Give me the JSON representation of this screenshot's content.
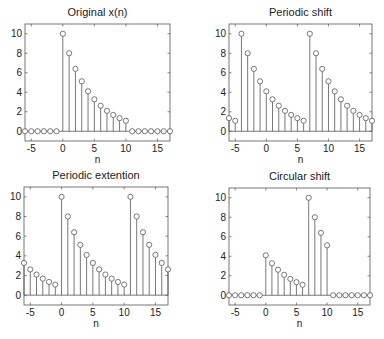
{
  "figure": {
    "width": 384,
    "height": 339,
    "background": "#ffffff",
    "stem_color": "#555555",
    "marker_color": "#444444"
  },
  "chart_data": [
    {
      "type": "stem",
      "title": "Original x(n)",
      "xlabel": "n",
      "ylabel": "",
      "xlim": [
        -6,
        17
      ],
      "ylim": [
        -1,
        11
      ],
      "xticks": [
        -5,
        0,
        5,
        10,
        15
      ],
      "yticks": [
        0,
        2,
        4,
        6,
        8,
        10
      ],
      "box": {
        "left": 25,
        "top": 24,
        "right": 170,
        "bottom": 141
      },
      "x": [
        -6,
        -5,
        -4,
        -3,
        -2,
        -1,
        0,
        1,
        2,
        3,
        4,
        5,
        6,
        7,
        8,
        9,
        10,
        11,
        12,
        13,
        14,
        15,
        16,
        17
      ],
      "values": [
        0,
        0,
        0,
        0,
        0,
        0,
        10,
        8,
        6.4,
        5.12,
        4.096,
        3.277,
        2.621,
        2.097,
        1.678,
        1.342,
        1.074,
        0,
        0,
        0,
        0,
        0,
        0,
        0
      ]
    },
    {
      "type": "stem",
      "title": "Periodic shift",
      "xlabel": "n",
      "ylabel": "",
      "xlim": [
        -6,
        17
      ],
      "ylim": [
        -1,
        11
      ],
      "xticks": [
        -5,
        0,
        5,
        10,
        15
      ],
      "yticks": [
        0,
        2,
        4,
        6,
        8,
        10
      ],
      "box": {
        "left": 229,
        "top": 24,
        "right": 372,
        "bottom": 141
      },
      "x": [
        -6,
        -5,
        -4,
        -3,
        -2,
        -1,
        0,
        1,
        2,
        3,
        4,
        5,
        6,
        7,
        8,
        9,
        10,
        11,
        12,
        13,
        14,
        15,
        16,
        17
      ],
      "values": [
        1.342,
        1.074,
        10,
        8,
        6.4,
        5.12,
        4.096,
        3.277,
        2.621,
        2.097,
        1.678,
        1.342,
        1.074,
        10,
        8,
        6.4,
        5.12,
        4.096,
        3.277,
        2.621,
        2.097,
        1.678,
        1.342,
        1.074
      ]
    },
    {
      "type": "stem",
      "title": "Periodic extention",
      "xlabel": "n",
      "ylabel": "",
      "xlim": [
        -6,
        17
      ],
      "ylim": [
        -1,
        11
      ],
      "xticks": [
        -5,
        0,
        5,
        10,
        15
      ],
      "yticks": [
        0,
        2,
        4,
        6,
        8,
        10
      ],
      "box": {
        "left": 24,
        "top": 187,
        "right": 168,
        "bottom": 305
      },
      "x": [
        -6,
        -5,
        -4,
        -3,
        -2,
        -1,
        0,
        1,
        2,
        3,
        4,
        5,
        6,
        7,
        8,
        9,
        10,
        11,
        12,
        13,
        14,
        15,
        16,
        17
      ],
      "values": [
        3.277,
        2.621,
        2.097,
        1.678,
        1.342,
        1.074,
        10,
        8,
        6.4,
        5.12,
        4.096,
        3.277,
        2.621,
        2.097,
        1.678,
        1.342,
        1.074,
        10,
        8,
        6.4,
        5.12,
        4.096,
        3.277,
        2.621
      ]
    },
    {
      "type": "stem",
      "title": "Circular shift",
      "xlabel": "n",
      "ylabel": "",
      "xlim": [
        -6,
        17
      ],
      "ylim": [
        -1,
        11
      ],
      "xticks": [
        -5,
        0,
        5,
        10,
        15
      ],
      "yticks": [
        0,
        2,
        4,
        6,
        8,
        10
      ],
      "box": {
        "left": 229,
        "top": 188,
        "right": 370,
        "bottom": 305
      },
      "x": [
        -6,
        -5,
        -4,
        -3,
        -2,
        -1,
        0,
        1,
        2,
        3,
        4,
        5,
        6,
        7,
        8,
        9,
        10,
        11,
        12,
        13,
        14,
        15,
        16,
        17
      ],
      "values": [
        0,
        0,
        0,
        0,
        0,
        0,
        4.096,
        3.277,
        2.621,
        2.097,
        1.678,
        1.342,
        1.074,
        10,
        8,
        6.4,
        5.12,
        0,
        0,
        0,
        0,
        0,
        0,
        0
      ]
    }
  ]
}
